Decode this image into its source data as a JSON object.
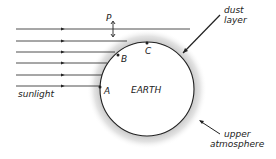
{
  "diagram": {
    "labels": {
      "P": "P",
      "A": "A",
      "B": "B",
      "C": "C",
      "earth": "EARTH",
      "sunlight": "sunlight",
      "dust_line1": "dust",
      "dust_line2": "layer",
      "upper_line1": "upper",
      "upper_line2": "atmosphere"
    },
    "colors": {
      "ink": "#222222",
      "dust": "#9a9a9a"
    }
  }
}
